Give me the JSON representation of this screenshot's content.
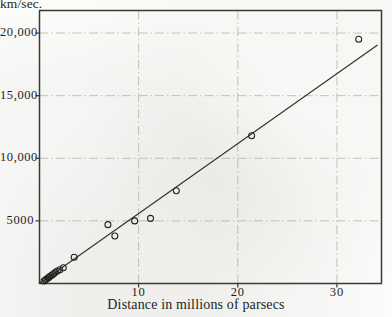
{
  "figure": {
    "y_axis_caption": "km/sec.",
    "x_axis_title": "Distance in millions of parsecs"
  },
  "chart_data": {
    "type": "scatter",
    "title": "",
    "subtitle": "",
    "xlabel": "Distance in millions of parsecs",
    "ylabel": "km/sec.",
    "xlim": [
      0,
      34.5
    ],
    "ylim": [
      0,
      21800
    ],
    "grid": true,
    "grid_style": "dash-dot",
    "legend": null,
    "xticks": [
      10,
      20,
      30
    ],
    "xtick_labels": [
      "10",
      "20",
      "30"
    ],
    "yticks": [
      5000,
      10000,
      15000,
      20000
    ],
    "ytick_labels": [
      "5000",
      "10,000",
      "15,000",
      "20,000"
    ],
    "marker": "open-circle",
    "series": [
      {
        "name": "Nebulae",
        "points": [
          [
            0.45,
            200
          ],
          [
            0.6,
            290
          ],
          [
            0.75,
            370
          ],
          [
            0.9,
            460
          ],
          [
            1.0,
            540
          ],
          [
            1.15,
            620
          ],
          [
            1.3,
            700
          ],
          [
            1.45,
            800
          ],
          [
            1.6,
            900
          ],
          [
            1.8,
            1000
          ],
          [
            2.05,
            1100
          ],
          [
            2.4,
            1250
          ],
          [
            3.5,
            2100
          ],
          [
            6.9,
            4700
          ],
          [
            7.6,
            3800
          ],
          [
            9.6,
            5000
          ],
          [
            11.2,
            5200
          ],
          [
            13.8,
            7400
          ],
          [
            21.4,
            11800
          ],
          [
            32.2,
            19500
          ]
        ]
      }
    ],
    "fit_line": {
      "name": "velocity-distance relation",
      "x_start": 0.0,
      "y_start": 0,
      "x_end": 34.1,
      "y_end": 19050,
      "slope": 559
    }
  }
}
